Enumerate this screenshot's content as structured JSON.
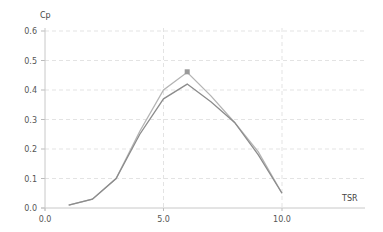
{
  "chart_data": {
    "type": "line",
    "title": "",
    "xlabel": "TSR",
    "ylabel": "Cp",
    "xlim": [
      0,
      13.5
    ],
    "ylim": [
      0,
      0.6
    ],
    "grid": true,
    "x_ticks": [
      "0.0",
      "5.0",
      "10.0"
    ],
    "y_ticks": [
      "0.0",
      "0.1",
      "0.2",
      "0.3",
      "0.4",
      "0.5",
      "0.6"
    ],
    "x": [
      1,
      2,
      3,
      4,
      5,
      6,
      7,
      8,
      9,
      10
    ],
    "series": [
      {
        "name": "upper",
        "color": "#b4b4b4",
        "values": [
          0.01,
          0.03,
          0.1,
          0.26,
          0.4,
          0.46,
          0.38,
          0.29,
          0.19,
          0.05
        ],
        "marker_at_index": 5
      },
      {
        "name": "lower",
        "color": "#8c8c8c",
        "values": [
          0.01,
          0.03,
          0.1,
          0.25,
          0.37,
          0.42,
          0.36,
          0.29,
          0.18,
          0.05
        ]
      }
    ],
    "legend": null
  }
}
